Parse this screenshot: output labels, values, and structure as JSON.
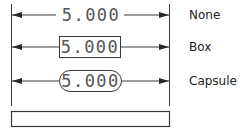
{
  "diagram": {
    "dimension_value": "5.000",
    "rows": [
      {
        "style": "none",
        "value": "5.000",
        "label": "None"
      },
      {
        "style": "box",
        "value": "5.000",
        "label": "Box"
      },
      {
        "style": "capsule",
        "value": "5.000",
        "label": "Capsule"
      }
    ],
    "colors": {
      "line": "#3a3a3a",
      "text": "#555555",
      "label": "#222222",
      "background": "#ffffff"
    }
  }
}
